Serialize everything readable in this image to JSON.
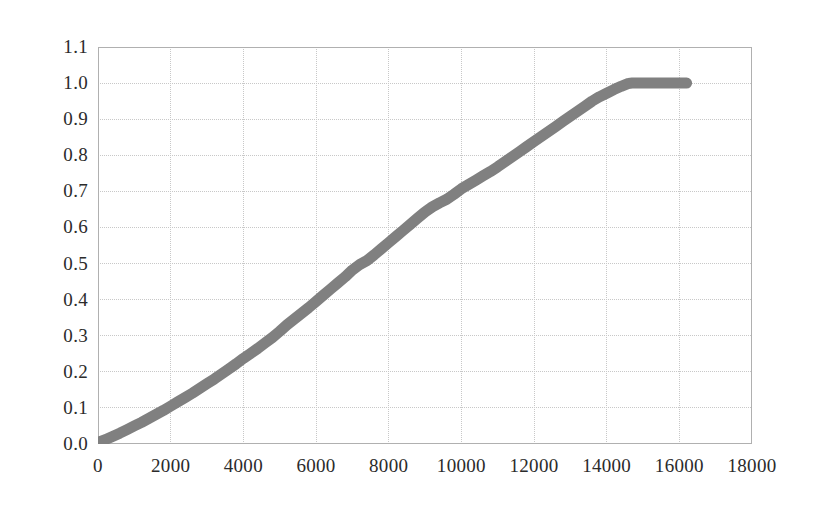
{
  "chart_data": {
    "type": "line",
    "title": "",
    "subtitle": "",
    "xlabel": "",
    "ylabel": "",
    "xlim": [
      0,
      18000
    ],
    "ylim": [
      0.0,
      1.1
    ],
    "grid": true,
    "legend": false,
    "legend_position": "none",
    "series_color": "#808080",
    "grid_color": "#c8c8c8",
    "axis_color": "#b0b0b0",
    "tick_label_color": "#2b2b2b",
    "background": "#ffffff",
    "x_ticks": [
      0,
      2000,
      4000,
      6000,
      8000,
      10000,
      12000,
      14000,
      16000,
      18000
    ],
    "x_tick_labels": [
      "0",
      "2000",
      "4000",
      "6000",
      "8000",
      "10000",
      "12000",
      "14000",
      "16000",
      "18000"
    ],
    "y_ticks": [
      0.0,
      0.1,
      0.2,
      0.3,
      0.4,
      0.5,
      0.6,
      0.7,
      0.8,
      0.9,
      1.0,
      1.1
    ],
    "y_tick_labels": [
      "0.0",
      "0.1",
      "0.2",
      "0.3",
      "0.4",
      "0.5",
      "0.6",
      "0.7",
      "0.8",
      "0.9",
      "1.0",
      "1.1"
    ],
    "series": [
      {
        "name": "cumulative-distribution",
        "color": "#808080",
        "line_width": 11,
        "marker": "none",
        "x": [
          0,
          200,
          400,
          600,
          800,
          1000,
          1200,
          1400,
          1600,
          1800,
          2000,
          2200,
          2400,
          2600,
          2800,
          3000,
          3200,
          3400,
          3600,
          3800,
          4000,
          4200,
          4400,
          4600,
          4800,
          5000,
          5200,
          5400,
          5600,
          5800,
          6000,
          6200,
          6400,
          6600,
          6800,
          7000,
          7200,
          7400,
          7600,
          7800,
          8000,
          8200,
          8400,
          8600,
          8800,
          9000,
          9200,
          9400,
          9600,
          9800,
          10000,
          10200,
          10400,
          10600,
          10800,
          11000,
          11200,
          11400,
          11600,
          11800,
          12000,
          12200,
          12400,
          12600,
          12800,
          13000,
          13200,
          13400,
          13600,
          13800,
          14000,
          14200,
          14400,
          14600,
          14700,
          15000,
          15400,
          15800,
          16200
        ],
        "y": [
          0.005,
          0.012,
          0.021,
          0.03,
          0.04,
          0.05,
          0.06,
          0.071,
          0.082,
          0.093,
          0.105,
          0.117,
          0.129,
          0.141,
          0.154,
          0.167,
          0.18,
          0.194,
          0.208,
          0.222,
          0.237,
          0.251,
          0.265,
          0.28,
          0.295,
          0.312,
          0.33,
          0.346,
          0.362,
          0.378,
          0.395,
          0.412,
          0.429,
          0.446,
          0.463,
          0.482,
          0.497,
          0.508,
          0.524,
          0.541,
          0.558,
          0.575,
          0.592,
          0.609,
          0.626,
          0.643,
          0.657,
          0.668,
          0.678,
          0.692,
          0.707,
          0.719,
          0.731,
          0.743,
          0.755,
          0.768,
          0.782,
          0.796,
          0.81,
          0.824,
          0.838,
          0.852,
          0.866,
          0.88,
          0.894,
          0.908,
          0.922,
          0.936,
          0.95,
          0.962,
          0.972,
          0.982,
          0.991,
          0.999,
          1.0,
          1.0,
          1.0,
          1.0,
          1.0
        ]
      }
    ]
  }
}
